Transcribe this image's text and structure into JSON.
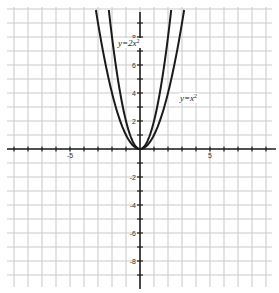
{
  "chart_data": {
    "type": "line",
    "title": "",
    "xlabel": "",
    "ylabel": "",
    "xlim": [
      -10,
      10
    ],
    "ylim": [
      -10,
      10
    ],
    "grid": true,
    "x_tick_labels": [
      {
        "value": -5,
        "label": "-5"
      },
      {
        "value": 5,
        "label": "5"
      }
    ],
    "y_tick_labels": [
      {
        "value": 8,
        "label": "8"
      },
      {
        "value": 6,
        "label": "6"
      },
      {
        "value": 4,
        "label": "4"
      },
      {
        "value": 2,
        "label": "2"
      },
      {
        "value": -2,
        "label": "-2"
      },
      {
        "value": -4,
        "label": "-4"
      },
      {
        "value": -6,
        "label": "-6"
      },
      {
        "value": -8,
        "label": "-8"
      }
    ],
    "series": [
      {
        "name": "y=2x²",
        "label_base": "y=2x",
        "label_exp": "2",
        "function": "2*x^2",
        "x": [
          -2.2,
          -2,
          -1.5,
          -1,
          -0.5,
          0,
          0.5,
          1,
          1.5,
          2,
          2.2
        ],
        "y": [
          9.68,
          8,
          4.5,
          2,
          0.5,
          0,
          0.5,
          2,
          4.5,
          8,
          9.68
        ]
      },
      {
        "name": "y=x²",
        "label_base": "y=x",
        "label_exp": "2",
        "function": "x^2",
        "x": [
          -3.1,
          -3,
          -2,
          -1,
          0,
          1,
          2,
          3,
          3.1
        ],
        "y": [
          9.61,
          9,
          4,
          1,
          0,
          1,
          4,
          9,
          9.61
        ]
      }
    ],
    "annotations": [
      {
        "text": "y=2x²",
        "x": 0.2,
        "y": 7.4
      },
      {
        "text": "y=x²",
        "x": 3.3,
        "y": 3.6
      }
    ]
  },
  "colors": {
    "grid": "#c9c9c9",
    "axis": "#1e1e1e",
    "curve": "#1a1a1a",
    "background": "#ffffff"
  }
}
